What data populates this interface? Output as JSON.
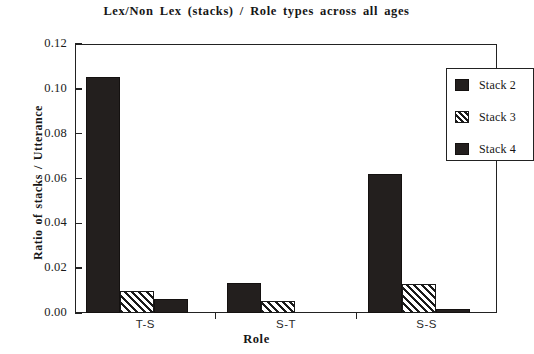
{
  "chart_data": {
    "type": "bar",
    "title": "Lex/Non Lex (stacks) / Role types across all ages",
    "xlabel": "Role",
    "ylabel": "Ratio of stacks / Utterance",
    "categories": [
      "T-S",
      "S-T",
      "S-S"
    ],
    "series": [
      {
        "name": "Stack 2",
        "values": [
          0.1055,
          0.0135,
          0.062
        ],
        "fill": "solid",
        "color": "#231f1e"
      },
      {
        "name": "Stack 3",
        "values": [
          0.01,
          0.0052,
          0.0128
        ],
        "fill": "hatch",
        "color": "#1a1a1a"
      },
      {
        "name": "Stack 4",
        "values": [
          0.0063,
          0.0,
          0.0016
        ],
        "fill": "solid",
        "color": "#231f1e"
      }
    ],
    "ylim": [
      0.0,
      0.12
    ],
    "yticks": [
      "0.00",
      "0.02",
      "0.04",
      "0.06",
      "0.08",
      "0.10",
      "0.12"
    ],
    "ytick_values": [
      0.0,
      0.02,
      0.04,
      0.06,
      0.08,
      0.1,
      0.12
    ],
    "grid": false,
    "legend_position": "top-right",
    "legend_entries": [
      "Stack 2",
      "Stack 3",
      "Stack 4"
    ]
  },
  "axes": {
    "y_label": "Ratio of stacks / Utterance",
    "x_label": "Role"
  },
  "title": "Lex/Non Lex (stacks) / Role types across all ages"
}
